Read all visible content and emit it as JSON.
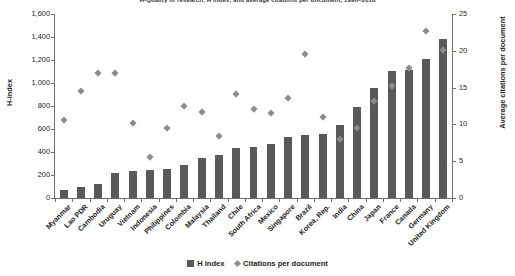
{
  "chart_data": {
    "type": "bar",
    "title": "H-Quality of research, H index, and average citations per document, 1996–2018",
    "xlabel": "",
    "ylabel": "H-index",
    "y2label": "Average citations per document",
    "ylim": [
      0,
      1600
    ],
    "y2lim": [
      0,
      25
    ],
    "yticks": [
      "0",
      "200",
      "400",
      "600",
      "800",
      "1,000",
      "1,200",
      "1,400",
      "1,600"
    ],
    "ytick_values": [
      0,
      200,
      400,
      600,
      800,
      1000,
      1200,
      1400,
      1600
    ],
    "y2ticks": [
      "0",
      "5",
      "10",
      "15",
      "20",
      "25"
    ],
    "y2tick_values": [
      0,
      5,
      10,
      15,
      20,
      25
    ],
    "grid": false,
    "legend_position": "bottom",
    "categories": [
      "Myanmar",
      "Lao PDR",
      "Cambodia",
      "Uruguay",
      "Vietnam",
      "Indonesia",
      "Philippines",
      "Colombia",
      "Malaysia",
      "Thailand",
      "Chile",
      "South Africa",
      "Mexico",
      "Singapore",
      "Brazil",
      "Korea, Rep.",
      "India",
      "China",
      "Japan",
      "France",
      "Canada",
      "Germany",
      "United Kingdom"
    ],
    "series": [
      {
        "name": "H index",
        "type": "bar",
        "axis": "left",
        "color": "#595959",
        "values": [
          70,
          95,
          120,
          215,
          235,
          240,
          250,
          285,
          345,
          375,
          435,
          440,
          470,
          530,
          545,
          555,
          635,
          790,
          960,
          1105,
          1110,
          1205,
          1385
        ]
      },
      {
        "name": "Citations per document",
        "type": "scatter",
        "axis": "right",
        "marker": "diamond",
        "color": "#8c8c8c",
        "values": [
          10.5,
          14.5,
          17.0,
          16.9,
          10.2,
          5.5,
          9.4,
          12.4,
          11.6,
          8.4,
          14.1,
          12.1,
          11.5,
          13.6,
          19.5,
          10.9,
          8.0,
          9.4,
          13.1,
          15.2,
          17.6,
          22.6,
          20.0
        ]
      }
    ]
  },
  "axes": {
    "left_title": "H-index",
    "right_title": "Average citations per document"
  },
  "legend": {
    "items": [
      {
        "label": "H index",
        "marker": "square-swatch-icon"
      },
      {
        "label": "Citations per document",
        "marker": "diamond-swatch-icon"
      }
    ]
  }
}
